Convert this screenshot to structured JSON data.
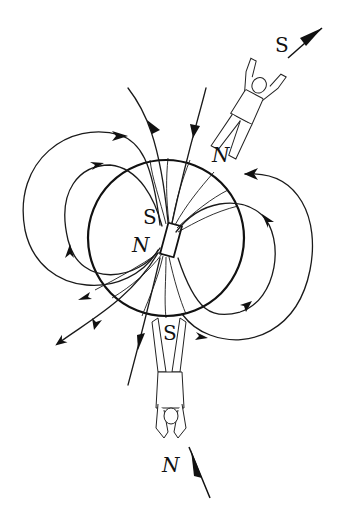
{
  "diagram": {
    "labels": {
      "top_compass_pole": "S",
      "top_person_pole": "N",
      "magnet_top_pole": "S",
      "magnet_bottom_pole": "N",
      "bottom_person_pole": "S",
      "bottom_compass_pole": "N"
    },
    "elements": {
      "earth": "circle",
      "magnet": "bar-magnet",
      "observers": [
        "person-top-upright",
        "person-bottom-inverted"
      ],
      "field_lines": "dipole loops with direction arrows"
    },
    "colors": {
      "stroke": "#111111",
      "background": "#ffffff"
    }
  }
}
